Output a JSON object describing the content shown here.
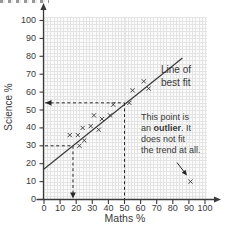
{
  "chart_data": {
    "type": "scatter",
    "title": "",
    "xlabel": "Maths %",
    "ylabel": "Science %",
    "xlim": [
      0,
      100
    ],
    "ylim": [
      0,
      100
    ],
    "xticks": [
      0,
      10,
      20,
      30,
      40,
      50,
      60,
      70,
      80,
      90,
      100
    ],
    "yticks": [
      0,
      10,
      20,
      30,
      40,
      50,
      60,
      70,
      80,
      90,
      100
    ],
    "grid": "fine light-grey minor grid, 2-unit spacing",
    "marker": "x",
    "points": [
      [
        16,
        36
      ],
      [
        21,
        36
      ],
      [
        22,
        30
      ],
      [
        25,
        33
      ],
      [
        24,
        40
      ],
      [
        29,
        41
      ],
      [
        34,
        39
      ],
      [
        31,
        47
      ],
      [
        36,
        45
      ],
      [
        41,
        47
      ],
      [
        43,
        53
      ],
      [
        53,
        54
      ],
      [
        55,
        61
      ],
      [
        62,
        66
      ],
      [
        65,
        62
      ]
    ],
    "outlier_point": [
      91,
      10
    ],
    "best_fit_line": {
      "x1": 0,
      "y1": 17,
      "x2": 86,
      "y2": 79
    },
    "dashed_readings": [
      {
        "x": 50,
        "y": 54,
        "arrow": "left"
      },
      {
        "x": 18,
        "y": 30,
        "arrow": "down"
      }
    ],
    "labels": {
      "best_fit_line1": "Line of",
      "best_fit_line2": "best fit",
      "outlier_note_line1": "This point is",
      "outlier_note_line2_pre": "an ",
      "outlier_note_line2_bold": "outlier",
      "outlier_note_line2_post": ". It",
      "outlier_note_line3": "does not fit",
      "outlier_note_line4": "the trend at all."
    },
    "colors": {
      "ink": "#3a3a3a",
      "grid_line": "#e4e4e4",
      "plot_bg": "#fbfbfb",
      "dash": "#262626"
    },
    "legend": "none"
  }
}
